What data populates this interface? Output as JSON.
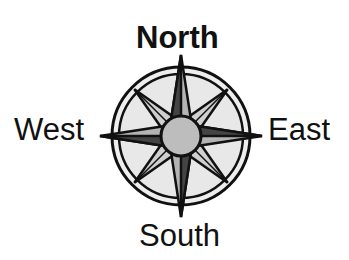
{
  "diagram": {
    "type": "compass-rose",
    "labels": {
      "north": "North",
      "south": "South",
      "east": "East",
      "west": "West"
    },
    "colors": {
      "stroke": "#111111",
      "fill_light": "#e6e6e6",
      "fill_mid": "#b4b4b4",
      "center": "#bdbdbd",
      "background": "#ffffff"
    }
  }
}
